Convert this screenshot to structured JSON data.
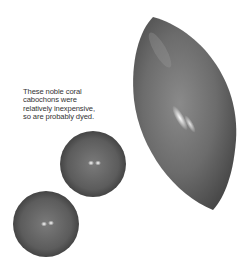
{
  "caption": {
    "lines": [
      "These noble coral",
      "cabochons were",
      "relatively inexpensive,",
      "so are probably dyed."
    ]
  },
  "objects": [
    {
      "name": "marquise-cabochon",
      "shape": "marquise",
      "color": "#6e6e6e"
    },
    {
      "name": "round-cabochon-upper",
      "shape": "round",
      "color": "#606060"
    },
    {
      "name": "round-cabochon-lower",
      "shape": "round",
      "color": "#606060"
    }
  ],
  "colors": {
    "background": "#ffffff",
    "stone_dark": "#3c3c3c",
    "stone_mid": "#6a6a6a",
    "highlight": "#f4f4f4"
  }
}
